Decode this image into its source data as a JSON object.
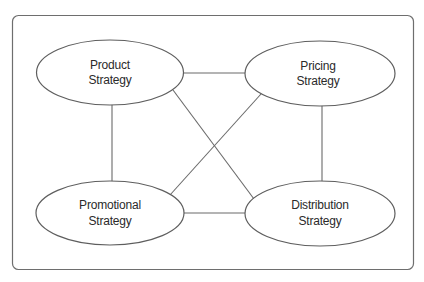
{
  "diagram": {
    "type": "relationship-diagram",
    "colors": {
      "frame": "#6e6e6e",
      "connector": "#6a6a6a",
      "node_stroke": "#5e5e5e",
      "node_fill": "#ffffff",
      "text": "#2a2a2a",
      "background": "#ffffff"
    },
    "nodes": [
      {
        "id": "product",
        "shape": "ellipse",
        "line1": "Product",
        "line2": "Strategy"
      },
      {
        "id": "pricing",
        "shape": "ellipse",
        "line1": "Pricing",
        "line2": "Strategy"
      },
      {
        "id": "promotional",
        "shape": "ellipse",
        "line1": "Promotional",
        "line2": "Strategy"
      },
      {
        "id": "distribution",
        "shape": "ellipse",
        "line1": "Distribution",
        "line2": "Strategy"
      }
    ],
    "edges": [
      {
        "from": "product",
        "to": "pricing"
      },
      {
        "from": "product",
        "to": "promotional"
      },
      {
        "from": "product",
        "to": "distribution"
      },
      {
        "from": "pricing",
        "to": "promotional"
      },
      {
        "from": "pricing",
        "to": "distribution"
      },
      {
        "from": "promotional",
        "to": "distribution"
      }
    ]
  }
}
